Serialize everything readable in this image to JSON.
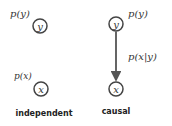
{
  "panels": [
    {
      "caption": "independent",
      "nodes": [
        {
          "id": "y",
          "label": "y",
          "prob": "p(y)"
        },
        {
          "id": "x",
          "label": "x",
          "prob": "p(x)"
        }
      ],
      "edges": []
    },
    {
      "caption": "causal",
      "nodes": [
        {
          "id": "y",
          "label": "y",
          "prob": "p(y)"
        },
        {
          "id": "x",
          "label": "x"
        }
      ],
      "edges": [
        {
          "from": "y",
          "to": "x",
          "label": "p(x|y)"
        }
      ]
    }
  ],
  "colors": {
    "node_stroke": "#444444",
    "edge": "#555555",
    "text": "#333333"
  }
}
